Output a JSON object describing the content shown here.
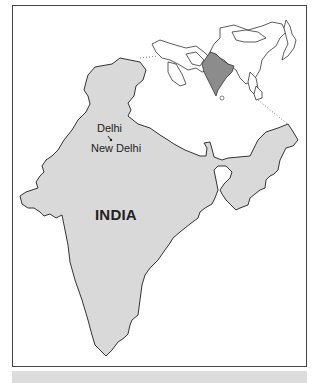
{
  "map": {
    "title": "INDIA",
    "cities": [
      {
        "name": "Delhi"
      },
      {
        "name": "New Delhi"
      }
    ],
    "inset": {
      "region": "Asia",
      "highlighted_country": "India"
    },
    "colors": {
      "land_fill": "#d9d9d9",
      "inset_highlight": "#8c8c8c",
      "border": "#333333",
      "frame": "#444444",
      "caption_bar": "#dcdcdc"
    }
  }
}
